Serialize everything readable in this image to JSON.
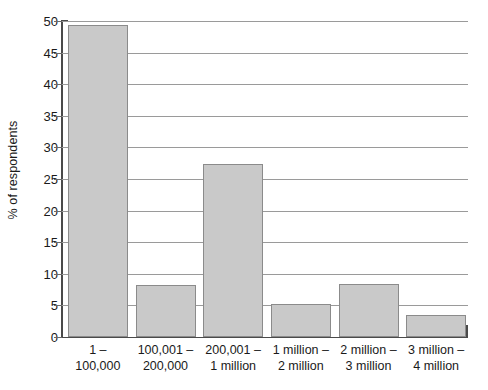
{
  "chart_data": {
    "type": "bar",
    "title": "",
    "subtitle": "",
    "xlabel": "",
    "ylabel": "% of respondents",
    "ylim": [
      0,
      50
    ],
    "ytick_step": 5,
    "yticks": [
      50,
      45,
      40,
      35,
      30,
      25,
      20,
      15,
      10,
      5,
      0
    ],
    "grid": true,
    "legend": null,
    "categories": [
      "1 – 100,000",
      "100,001 – 200,000",
      "200,001 – 1 million",
      "1 million – 2 million",
      "2 million – 3 million",
      "3 million – 4 million"
    ],
    "category_lines": [
      {
        "line1": "1 –",
        "line2": "100,000"
      },
      {
        "line1": "100,001 –",
        "line2": "200,000"
      },
      {
        "line1": "200,001 –",
        "line2": "1 million"
      },
      {
        "line1": "1 million –",
        "line2": "2 million"
      },
      {
        "line1": "2 million –",
        "line2": "3 million"
      },
      {
        "line1": "3 million –",
        "line2": "4 million"
      }
    ],
    "values": [
      49.4,
      8.2,
      27.3,
      5.3,
      8.4,
      3.5
    ],
    "bar_color": "#c9c9c9",
    "bar_border_color": "#8b8b8b",
    "grid_color": "#9a9a9a",
    "axis_color": "#4a4a4a"
  }
}
